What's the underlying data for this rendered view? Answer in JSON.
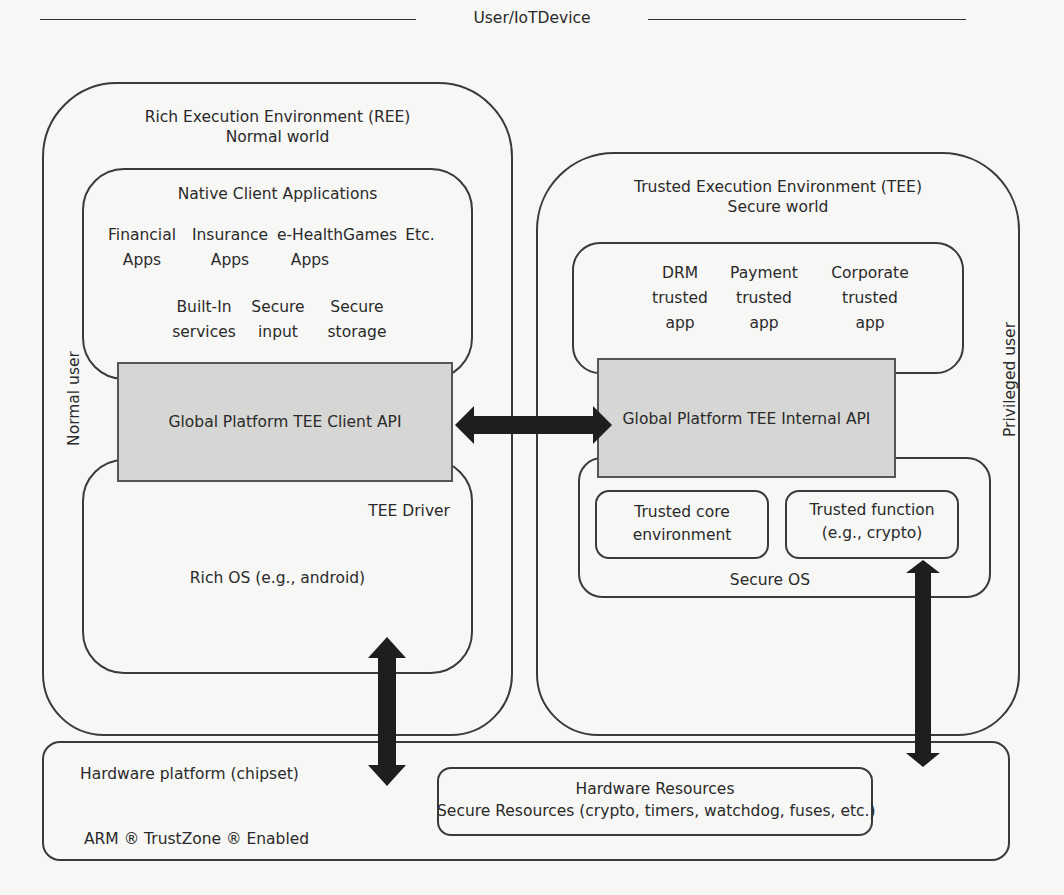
{
  "title": "User/IoTDevice",
  "ree": {
    "title": "Rich Execution Environment (REE)",
    "subtitle": "Normal world",
    "side_label": "Normal user",
    "native_apps": {
      "title": "Native Client Applications",
      "apps": [
        {
          "line1": "Financial",
          "line2": "Apps"
        },
        {
          "line1": "Insurance",
          "line2": "Apps"
        },
        {
          "line1": "e-Health",
          "line2": "Apps"
        },
        {
          "line1": "Games",
          "line2": ""
        },
        {
          "line1": "Etc.",
          "line2": ""
        }
      ],
      "services": [
        {
          "line1": "Built-In",
          "line2": "services"
        },
        {
          "line1": "Secure",
          "line2": "input"
        },
        {
          "line1": "Secure",
          "line2": "storage"
        }
      ]
    },
    "client_api": "Global Platform TEE Client API",
    "tee_driver": "TEE Driver",
    "rich_os": "Rich OS (e.g., android)"
  },
  "tee": {
    "title": "Trusted Execution Environment (TEE)",
    "subtitle": "Secure world",
    "side_label": "Privileged user",
    "trusted_apps": [
      {
        "line1": "DRM",
        "line2": "trusted",
        "line3": "app"
      },
      {
        "line1": "Payment",
        "line2": "trusted",
        "line3": "app"
      },
      {
        "line1": "Corporate",
        "line2": "trusted",
        "line3": "app"
      }
    ],
    "internal_api": "Global Platform TEE Internal API",
    "secure_os": {
      "label": "Secure OS",
      "core": {
        "line1": "Trusted core",
        "line2": "environment"
      },
      "function": {
        "line1": "Trusted function",
        "line2": "(e.g., crypto)"
      }
    }
  },
  "hardware": {
    "platform": "Hardware platform (chipset)",
    "trustzone": "ARM ® TrustZone ® Enabled",
    "resources_title": "Hardware Resources",
    "resources_detail": "Secure Resources (crypto, timers, watchdog, fuses, etc.)"
  },
  "colors": {
    "line": "#3a3a3a",
    "api_fill": "#d6d6d4",
    "arrow": "#1e1e1e",
    "background": "#f7f7f5"
  }
}
